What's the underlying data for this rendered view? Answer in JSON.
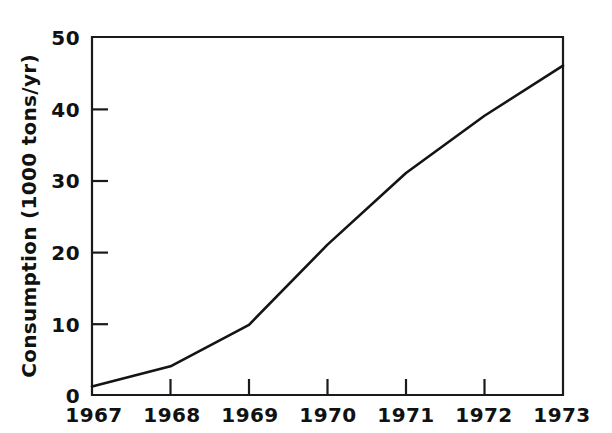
{
  "chart_data": {
    "type": "line",
    "title": "",
    "subtitle": "",
    "xlabel": "",
    "ylabel": "Consumption (1000 tons/yr)",
    "x": [
      1967,
      1968,
      1969,
      1970,
      1971,
      1972,
      1973
    ],
    "categories": [
      "1967",
      "1968",
      "1969",
      "1970",
      "1971",
      "1972",
      "1973"
    ],
    "values": [
      1.2,
      4,
      9.8,
      21,
      31,
      39,
      46
    ],
    "series": [
      {
        "name": "Consumption",
        "values": [
          1.2,
          4,
          9.8,
          21,
          31,
          39,
          46
        ],
        "color": "#141414"
      }
    ],
    "xlim": [
      1967,
      1973
    ],
    "ylim": [
      0,
      50
    ],
    "ytick_labels": [
      "0",
      "10",
      "20",
      "30",
      "40",
      "50"
    ],
    "ytick_values": [
      0,
      10,
      20,
      30,
      40,
      50
    ],
    "xtick_labels": [
      "1967",
      "1968",
      "1969",
      "1970",
      "1971",
      "1972",
      "1973"
    ],
    "grid": false,
    "legend": false,
    "legend_position": "none",
    "annotations": []
  },
  "axis": {
    "y_label": "Consumption (1000 tons/yr)",
    "y_ticks": [
      {
        "label": "50",
        "value": 50
      },
      {
        "label": "40",
        "value": 40
      },
      {
        "label": "30",
        "value": 30
      },
      {
        "label": "20",
        "value": 20
      },
      {
        "label": "10",
        "value": 10
      },
      {
        "label": "0",
        "value": 0
      }
    ],
    "x_ticks": [
      {
        "label": "1967",
        "value": 1967
      },
      {
        "label": "1968",
        "value": 1968
      },
      {
        "label": "1969",
        "value": 1969
      },
      {
        "label": "1970",
        "value": 1970
      },
      {
        "label": "1971",
        "value": 1971
      },
      {
        "label": "1972",
        "value": 1972
      },
      {
        "label": "1973",
        "value": 1973
      }
    ]
  },
  "colors": {
    "line": "#141414",
    "axis": "#1a1a1a",
    "background": "#ffffff",
    "text": "#111111"
  }
}
